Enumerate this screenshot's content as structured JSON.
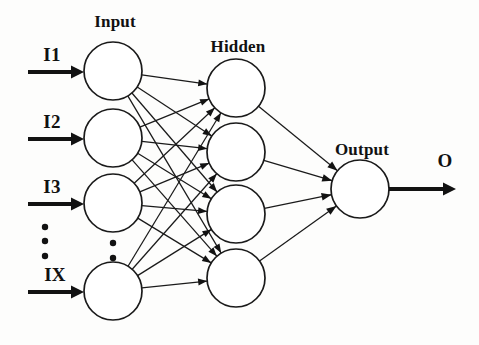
{
  "diagram": {
    "type": "feedforward-neural-network",
    "canvas": {
      "width": 479,
      "height": 345,
      "background": "#fdfdfc"
    },
    "stroke_color": "#1a1a1a",
    "layer_labels": {
      "input": "Input",
      "hidden": "Hidden",
      "output": "Output"
    },
    "input_labels": [
      "I1",
      "I2",
      "I3",
      "IX"
    ],
    "output_label": "O",
    "ellipsis_glyph": "•",
    "layers": {
      "input": {
        "name": "Input",
        "label_x": 115,
        "label_y": 12,
        "count": 4,
        "cx": 113,
        "r": 29,
        "cys": [
          71,
          138,
          203,
          291
        ]
      },
      "hidden": {
        "name": "Hidden",
        "label_x": 238,
        "label_y": 37,
        "count": 4,
        "cx": 236,
        "r": 29,
        "cys": [
          88,
          152,
          214,
          278
        ]
      },
      "output": {
        "name": "Output",
        "label_x": 362,
        "label_y": 140,
        "count": 1,
        "cx": 360,
        "r": 29,
        "cys": [
          189
        ]
      }
    },
    "input_arrows": [
      {
        "label": "I1",
        "y": 72,
        "x1": 28,
        "x2": 84,
        "label_x": 52,
        "label_y": 44
      },
      {
        "label": "I2",
        "y": 139,
        "x1": 28,
        "x2": 84,
        "label_x": 52,
        "label_y": 111
      },
      {
        "label": "I3",
        "y": 204,
        "x1": 28,
        "x2": 84,
        "label_x": 52,
        "label_y": 176
      },
      {
        "label": "IX",
        "y": 292,
        "x1": 28,
        "x2": 84,
        "label_x": 55,
        "label_y": 264
      }
    ],
    "output_arrow": {
      "label": "O",
      "y": 189,
      "x1": 389,
      "x2": 456,
      "label_x": 445,
      "label_y": 150
    },
    "left_ellipsis": {
      "x": 45,
      "ys": [
        227,
        241,
        256
      ],
      "r": 3.2
    },
    "input_ellipsis": {
      "x": 113,
      "ys": [
        243,
        258
      ],
      "r": 3.2
    }
  }
}
